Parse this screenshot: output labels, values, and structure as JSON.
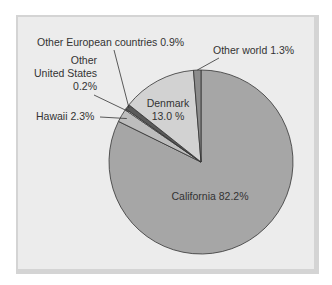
{
  "chart_data": {
    "type": "pie",
    "title": "",
    "slices": [
      {
        "label": "California",
        "value": 82.2,
        "display": "California 82.2%",
        "color": "#a6a6a6"
      },
      {
        "label": "Hawaii",
        "value": 2.3,
        "display": "Hawaii 2.3%",
        "color": "#bdbdbd"
      },
      {
        "label": "Other United States",
        "value": 0.2,
        "display": [
          "Other",
          "United States",
          "0.2%"
        ],
        "color": "#ffffff"
      },
      {
        "label": "Other European countries",
        "value": 0.9,
        "display": "Other European countries 0.9%",
        "color": "#5a5a5a"
      },
      {
        "label": "Denmark",
        "value": 13.0,
        "display": [
          "Denmark",
          "13.0 %"
        ],
        "color": "#d2d2d2"
      },
      {
        "label": "Other world",
        "value": 1.3,
        "display": "Other world 1.3%",
        "color": "#8c8c8c"
      }
    ],
    "start": "12 o'clock",
    "direction": "clockwise",
    "legend": "none"
  }
}
